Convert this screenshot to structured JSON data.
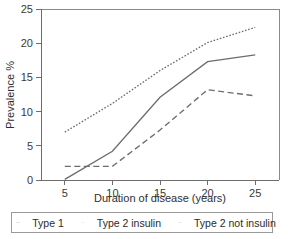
{
  "chart_data": {
    "type": "line",
    "title": "",
    "xlabel": "Duration of disease (years)",
    "ylabel": "Prevalence %",
    "x": [
      5,
      10,
      15,
      20,
      25
    ],
    "xtick_labels": [
      "5",
      "10",
      "15",
      "20",
      "25"
    ],
    "ytick_labels": [
      "0",
      "5",
      "10",
      "15",
      "20",
      "25"
    ],
    "xlim": [
      2.5,
      27.5
    ],
    "ylim": [
      0,
      25
    ],
    "grid": false,
    "legend_position": "bottom",
    "series": [
      {
        "name": "Type 1",
        "style": "solid",
        "color": "#6d6d6d",
        "values": [
          0.1,
          4.2,
          12.1,
          17.3,
          18.3
        ]
      },
      {
        "name": "Type 2 insulin",
        "style": "dotted",
        "color": "#6d6d6d",
        "values": [
          7.0,
          11.2,
          16.0,
          20.1,
          22.3
        ]
      },
      {
        "name": "Type 2 not insulin",
        "style": "dashed",
        "color": "#6d6d6d",
        "values": [
          2.0,
          2.0,
          7.3,
          13.2,
          12.3
        ]
      }
    ]
  },
  "axes": {
    "y_title": "Prevalence %",
    "x_title": "Duration of disease (years)",
    "y_ticks": [
      "0",
      "5",
      "10",
      "15",
      "20",
      "25"
    ],
    "x_ticks": [
      "5",
      "10",
      "15",
      "20",
      "25"
    ]
  },
  "legend": {
    "items": [
      {
        "label": "Type 1",
        "style": "solid"
      },
      {
        "label": "Type 2 insulin",
        "style": "dotted"
      },
      {
        "label": "Type 2 not insulin",
        "style": "dashed"
      }
    ]
  }
}
